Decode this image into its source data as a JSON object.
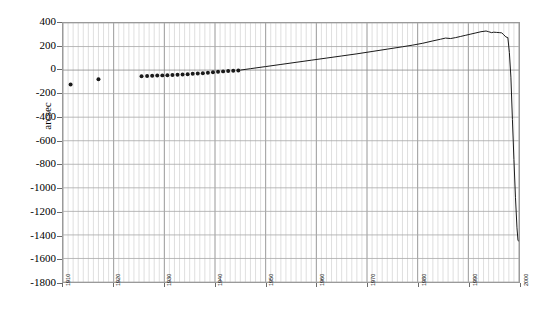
{
  "chart_data": {
    "type": "line",
    "title": "",
    "subtitle": "",
    "xlabel": "",
    "ylabel": "arcsec",
    "xlim": [
      1910,
      2000
    ],
    "ylim": [
      -1800,
      400
    ],
    "ytick_step": 200,
    "xtick_step": 10,
    "grid": true,
    "minor_grid_x": true,
    "legend": "none",
    "y_ticks": [
      400,
      200,
      0,
      -200,
      -400,
      -600,
      -800,
      -1000,
      -1200,
      -1400,
      -1600,
      -1800
    ],
    "y_tick_labels": [
      "400",
      "200",
      "0",
      "-200",
      "-400",
      "-600",
      "-800",
      "-1000",
      "-1200",
      "-1400",
      "-1600",
      "-1800"
    ],
    "x_ticks": [
      1910,
      1920,
      1930,
      1940,
      1950,
      1960,
      1970,
      1980,
      1990,
      2000
    ],
    "x_tick_labels": [
      "1910",
      "1920",
      "1930",
      "1940",
      "1950",
      "1960",
      "1970",
      "1980",
      "1990",
      "2000"
    ],
    "series": [
      {
        "name": "observed-points",
        "mode": "scatter",
        "marker": "filled-circle",
        "marker_size": 4,
        "color": "#1a1a1a",
        "x": [
          1911.5,
          1917.0,
          1925.5,
          1926.6,
          1927.6,
          1928.6,
          1929.6,
          1930.6,
          1931.6,
          1932.6,
          1933.6,
          1934.6,
          1935.6,
          1936.6,
          1937.6,
          1938.6,
          1939.6,
          1940.6,
          1941.6,
          1942.6,
          1943.6,
          1944.6
        ],
        "y": [
          -122,
          -78,
          -52,
          -50,
          -48,
          -46,
          -45,
          -43,
          -41,
          -39,
          -37,
          -35,
          -32,
          -29,
          -26,
          -22,
          -19,
          -15,
          -11,
          -8,
          -5,
          -3
        ]
      },
      {
        "name": "trend-curve",
        "mode": "line",
        "color": "#1a1a1a",
        "line_width": 1,
        "x": [
          1945.0,
          1947.0,
          1950.0,
          1953.0,
          1956.0,
          1959.0,
          1962.0,
          1965.0,
          1968.0,
          1971.0,
          1974.0,
          1977.0,
          1979.0,
          1981.0,
          1983.0,
          1984.5,
          1985.5,
          1986.5,
          1987.5,
          1988.5,
          1989.5,
          1990.5,
          1991.5,
          1992.5,
          1993.5,
          1994.0,
          1994.6,
          1995.0,
          1995.6,
          1996.2,
          1996.6,
          1997.0,
          1997.4,
          1997.8,
          1998.1,
          1998.4,
          1998.7,
          1999.0,
          1999.3,
          1999.6,
          1999.8,
          1999.95
        ],
        "y": [
          0,
          12,
          30,
          48,
          66,
          84,
          102,
          120,
          138,
          158,
          178,
          198,
          212,
          228,
          248,
          262,
          272,
          268,
          276,
          286,
          296,
          306,
          316,
          326,
          332,
          326,
          318,
          322,
          320,
          318,
          316,
          300,
          282,
          276,
          150,
          -60,
          -420,
          -760,
          -1080,
          -1340,
          -1448,
          -1452
        ]
      }
    ],
    "annotations": []
  }
}
